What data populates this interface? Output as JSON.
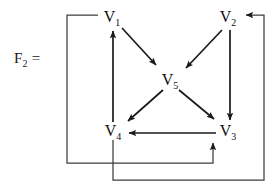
{
  "figure": {
    "equation_label": "F",
    "equation_subscript": "2",
    "equation_equals": " ="
  },
  "nodes": [
    {
      "id": "V1",
      "base": "V",
      "sub": "1",
      "x": 112,
      "y": 17
    },
    {
      "id": "V2",
      "base": "V",
      "sub": "2",
      "x": 228,
      "y": 17
    },
    {
      "id": "V5",
      "base": "V",
      "sub": "5",
      "x": 170,
      "y": 80
    },
    {
      "id": "V4",
      "base": "V",
      "sub": "4",
      "x": 113,
      "y": 131
    },
    {
      "id": "V3",
      "base": "V",
      "sub": "3",
      "x": 228,
      "y": 131
    }
  ],
  "edges": [
    {
      "name": "edge-v1-v5",
      "from": "V1",
      "to": "V5",
      "style": "diagonal"
    },
    {
      "name": "edge-v2-v5",
      "from": "V2",
      "to": "V5",
      "style": "diagonal"
    },
    {
      "name": "edge-v5-v4",
      "from": "V5",
      "to": "V4",
      "style": "diagonal"
    },
    {
      "name": "edge-v5-v3",
      "from": "V5",
      "to": "V3",
      "style": "diagonal"
    },
    {
      "name": "edge-v4-v1",
      "from": "V4",
      "to": "V1",
      "style": "vertical"
    },
    {
      "name": "edge-v2-v3",
      "from": "V2",
      "to": "V3",
      "style": "vertical"
    },
    {
      "name": "edge-v3-v4",
      "from": "V3",
      "to": "V4",
      "style": "horizontal"
    },
    {
      "name": "edge-v1-v3",
      "from": "V1",
      "to": "V3",
      "style": "routed-left-bottom"
    },
    {
      "name": "edge-v4-v2",
      "from": "V4",
      "to": "V2",
      "style": "routed-bottom-right"
    }
  ],
  "colors": {
    "background": "#ffffff",
    "stroke": "#1a1a1a",
    "routed_stroke": "#4a4a4a",
    "text": "#101010"
  }
}
